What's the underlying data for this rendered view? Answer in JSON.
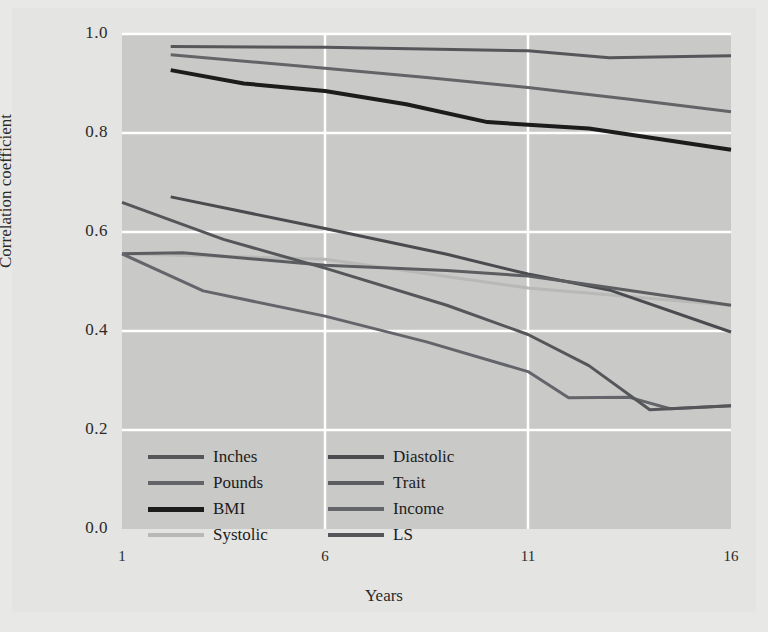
{
  "chart_data": {
    "type": "line",
    "title": "",
    "xlabel": "Years",
    "ylabel": "Correlation coefficient",
    "xlim": [
      1,
      16
    ],
    "ylim": [
      0.0,
      1.0
    ],
    "xticks": [
      1,
      6,
      11,
      16
    ],
    "xtick_labels": [
      "1",
      "6",
      "11",
      "16"
    ],
    "yticks": [
      0.0,
      0.2,
      0.4,
      0.6,
      0.8,
      1.0
    ],
    "ytick_labels": [
      "0.0",
      "0.2",
      "0.4",
      "0.6",
      "0.8",
      "1.0"
    ],
    "grid": true,
    "legend_position": "lower-left-inside",
    "plot_background": "#c9c9c7",
    "figure_background": "#e4e4e2",
    "gridline_color": "#ffffff",
    "series": [
      {
        "name": "Inches",
        "color": "#55565a",
        "width": 3,
        "x": [
          2.2,
          6,
          11,
          13,
          16
        ],
        "values": [
          0.975,
          0.973,
          0.966,
          0.952,
          0.956
        ]
      },
      {
        "name": "Pounds",
        "color": "#636468",
        "width": 3,
        "x": [
          2.2,
          6,
          8.5,
          11,
          13.5,
          16
        ],
        "values": [
          0.958,
          0.931,
          0.912,
          0.892,
          0.868,
          0.843
        ]
      },
      {
        "name": "BMI",
        "color": "#1c1c1c",
        "width": 4,
        "x": [
          2.2,
          4,
          6,
          8,
          10,
          12.5,
          16
        ],
        "values": [
          0.927,
          0.9,
          0.885,
          0.858,
          0.822,
          0.809,
          0.766
        ]
      },
      {
        "name": "Systolic",
        "color": "#b8b8b6",
        "width": 3,
        "x": [
          1,
          6,
          11,
          16
        ],
        "values": [
          0.556,
          0.545,
          0.487,
          0.452
        ]
      },
      {
        "name": "Diastolic",
        "color": "#4a4b4f",
        "width": 3,
        "x": [
          2.2,
          6,
          9,
          11,
          13,
          16
        ],
        "values": [
          0.671,
          0.607,
          0.555,
          0.515,
          0.483,
          0.398
        ]
      },
      {
        "name": "Trait",
        "color": "#5c5d61",
        "width": 3,
        "x": [
          1,
          2.5,
          6,
          9,
          11,
          13,
          16
        ],
        "values": [
          0.556,
          0.558,
          0.533,
          0.522,
          0.511,
          0.488,
          0.452
        ]
      },
      {
        "name": "Income",
        "color": "#64656a",
        "width": 3,
        "x": [
          1,
          3,
          6,
          8.5,
          11,
          12,
          13.5,
          14.5,
          16
        ],
        "values": [
          0.556,
          0.481,
          0.43,
          0.378,
          0.318,
          0.265,
          0.266,
          0.243,
          0.249
        ]
      },
      {
        "name": "LS",
        "color": "#55565a",
        "width": 3,
        "x": [
          1,
          3.5,
          6,
          9,
          11,
          12.5,
          14,
          16
        ],
        "values": [
          0.66,
          0.585,
          0.527,
          0.452,
          0.393,
          0.33,
          0.241,
          0.249
        ]
      }
    ]
  },
  "legend": {
    "left_column": [
      "Inches",
      "Pounds",
      "BMI",
      "Systolic"
    ],
    "right_column": [
      "Diastolic",
      "Trait",
      "Income",
      "LS"
    ]
  }
}
